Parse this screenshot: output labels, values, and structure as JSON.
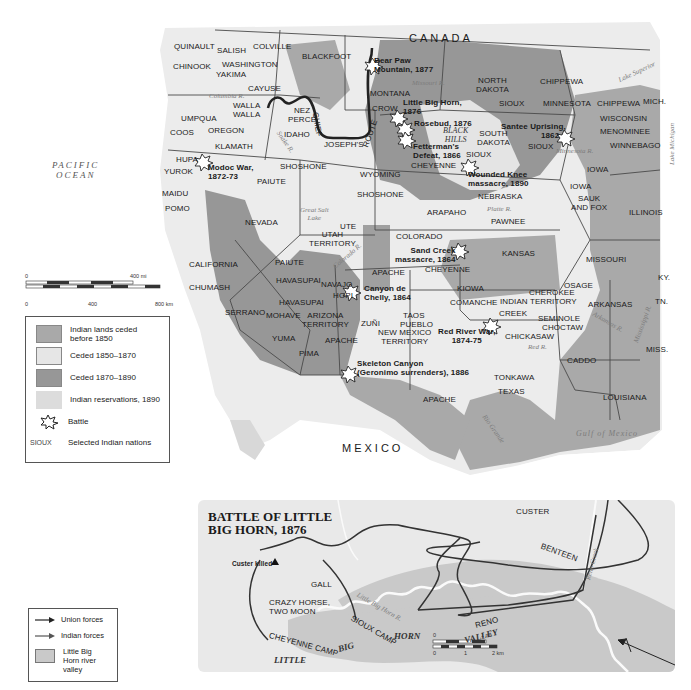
{
  "main_map": {
    "countries": {
      "canada": "CANADA",
      "mexico": "MEXICO"
    },
    "oceans": {
      "pacific": [
        "PACIFIC",
        "OCEAN"
      ],
      "gulf": "Gulf of Mexico"
    },
    "states": {
      "washington": "WASHINGTON",
      "oregon": "OREGON",
      "idaho": "IDAHO",
      "montana": "MONTANA",
      "wyoming": "WYOMING",
      "north_dakota": [
        "NORTH",
        "DAKOTA"
      ],
      "south_dakota": [
        "SOUTH",
        "DAKOTA"
      ],
      "nebraska": "NEBRASKA",
      "minnesota": "MINNESOTA",
      "wisconsin": "WISCONSIN",
      "mich": "MICH.",
      "iowa": "IOWA",
      "illinois": "ILLINOIS",
      "kansas": "KANSAS",
      "missouri": "MISSOURI",
      "ky": "KY.",
      "tn": "TN.",
      "arkansas": "ARKANSAS",
      "miss": "MISS.",
      "louisiana": "LOUISIANA",
      "texas": "TEXAS",
      "colorado": "COLORADO",
      "nevada": "NEVADA",
      "california": "CALIFORNIA",
      "utah_territory": [
        "UTAH",
        "TERRITORY"
      ],
      "arizona_territory": [
        "ARIZONA",
        "TERRITORY"
      ],
      "new_mexico_territory": [
        "NEW MEXICO",
        "TERRITORY"
      ],
      "indian_territory": "INDIAN TERRITORY"
    },
    "nations": {
      "quinault": "QUINAULT",
      "salish": "SALISH",
      "colville": "COLVILLE",
      "blackfoot": "BLACKFOOT",
      "chinook": "CHINOOK",
      "yakima": "YAKIMA",
      "cayuse": "CAYUSE",
      "walla_walla": [
        "WALLA",
        "WALLA"
      ],
      "umpqua": "UMPQUA",
      "coos": "COOS",
      "klamath": "KLAMATH",
      "nez_perce": [
        "NEZ",
        "PERCÉ"
      ],
      "hupa": "HUPA",
      "yurok": "YUROK",
      "shoshone_1": "SHOSHONE",
      "paiute_1": "PAIUTE",
      "maidu": "MAIDU",
      "pomo": "POMO",
      "crow": "CROW",
      "sioux_1": "SIOUX",
      "sioux_2": "SIOUX",
      "sioux_3": "SIOUX",
      "chippewa_1": "CHIPPEWA",
      "chippewa_2": "CHIPPEWA",
      "menominee": "MENOMINEE",
      "winnebago": "WINNEBAGO",
      "cheyenne_1": "CHEYENNE",
      "shoshone_2": "SHOSHONE",
      "sauk_fox": [
        "SAUK",
        "AND FOX"
      ],
      "iowa_nation": "IOWA",
      "pawnee": "PAWNEE",
      "arapaho": "ARAPAHO",
      "ute": "UTE",
      "cheyenne_2": "CHEYENNE",
      "apache_1": "APACHE",
      "paiute_2": "PAIUTE",
      "havasupai_1": "HAVASUPAI",
      "havasupai_2": "HAVASUPAI",
      "navajo": "NAVAJO",
      "hopi": "HOPI",
      "chumash": "CHUMASH",
      "serrano": "SERRANO",
      "mohave": "MOHAVE",
      "yuma": "YUMA",
      "pima": "PIMA",
      "apache_2": "APACHE",
      "zuni": "ZUÑI",
      "taos": "TAOS",
      "pueblo": "PUEBLO",
      "kiowa": "KIOWA",
      "comanche": "COMANCHE",
      "cherokee": "CHEROKEE",
      "creek": "CREEK",
      "osage": "OSAGE",
      "seminole": "SEMINOLE",
      "choctaw": "CHOCTAW",
      "chickasaw": "CHICKASAW",
      "caddo": "CADDO",
      "tonkawa": "TONKAWA",
      "apache_3": "APACHE"
    },
    "physical": {
      "columbia": "Columbia R.",
      "snake": "Snake R.",
      "missouri": "Missouri R.",
      "black_hills": [
        "BLACK",
        "HILLS"
      ],
      "great_salt_lake": [
        "Great Salt",
        "Lake"
      ],
      "colorado": "Colorado R.",
      "platte": "Platte R.",
      "minnesota": "Minnesota R.",
      "lake_superior": "Lake Superior",
      "lake_michigan": "Lake Michigan",
      "arkansas": "Arkansas R.",
      "mississippi": "Mississippi R.",
      "red": "Red R.",
      "rio_grande": "Rio Grande"
    },
    "route": [
      "CHIEF",
      "JOSEPH'S",
      "ROUTE"
    ],
    "battles": [
      {
        "name": "Bear Paw Mountain, 1877",
        "lines": [
          "Bear Paw",
          "Mountain, 1877"
        ]
      },
      {
        "name": "Little Big Horn, 1876",
        "lines": [
          "Little Big Horn,",
          "1876"
        ]
      },
      {
        "name": "Rosebud, 1876",
        "lines": [
          "Rosebud, 1876"
        ]
      },
      {
        "name": "Fetterman's Defeat, 1866",
        "lines": [
          "Fetterman's",
          "Defeat, 1866"
        ]
      },
      {
        "name": "Santee Uprising, 1862",
        "lines": [
          "Santee Uprising,",
          "1862"
        ]
      },
      {
        "name": "Wounded Knee massacre, 1890",
        "lines": [
          "Wounded Knee",
          "massacre, 1890"
        ]
      },
      {
        "name": "Modoc War, 1872-73",
        "lines": [
          "Modoc War,",
          "1872-73"
        ]
      },
      {
        "name": "Sand Creek massacre, 1864",
        "lines": [
          "Sand Creek",
          "massacre, 1864"
        ]
      },
      {
        "name": "Canyon de Chelly, 1864",
        "lines": [
          "Canyon de",
          "Chelly, 1864"
        ]
      },
      {
        "name": "Red River War, 1874-75",
        "lines": [
          "Red River War,",
          "1874-75"
        ]
      },
      {
        "name": "Skeleton Canyon (Geronimo surrenders), 1886",
        "lines": [
          "Skeleton Canyon",
          "(Geronimo surrenders), 1886"
        ]
      }
    ],
    "scale": {
      "mi_zero": "0",
      "mi_max": "400 mi",
      "km_zero": "0",
      "km_mid": "400",
      "km_max": "800 km"
    },
    "legend": {
      "items": [
        {
          "label": "Indian lands ceded before 1850",
          "lines": [
            "Indian lands ceded",
            "before 1850"
          ],
          "color": "#a9a9a9"
        },
        {
          "label": "Ceded 1850–1870",
          "lines": [
            "Ceded 1850–1870"
          ],
          "color": "#e4e4e4"
        },
        {
          "label": "Ceded 1870–1890",
          "lines": [
            "Ceded 1870–1890"
          ],
          "color": "#979797"
        },
        {
          "label": "Indian reservations, 1890",
          "lines": [
            "Indian reservations, 1890"
          ],
          "color": "#d4d4d4"
        }
      ],
      "battle_label": "Battle",
      "nation_sample": "SIOUX",
      "nation_label": "Selected Indian nations"
    },
    "colors": {
      "land_light": "#ececec",
      "ceded_pre1850": "#a9a9a9",
      "ceded_1850_1870": "#e4e4e4",
      "ceded_1870_1890": "#979797",
      "border": "#4a4a4a",
      "route": "#222222"
    }
  },
  "inset": {
    "title": [
      "BATTLE OF LITTLE",
      "BIG HORN, 1876"
    ],
    "labels": {
      "custer": "CUSTER",
      "benteen": "BENTEEN",
      "custer_killed": "Custer killed",
      "gall": "GALL",
      "crazy_horse": [
        "CRAZY HORSE,",
        "TWO MOON"
      ],
      "cheyenne_camp": "CHEYENNE CAMP",
      "sioux_camp": "SIOUX CAMP",
      "reno": "RENO",
      "little": "LITTLE",
      "big": "BIG",
      "horn": "HORN",
      "valley": "VALLEY",
      "little_big_horn_r": "Little Big Horn R.",
      "reno_creek": "Reno Creek"
    },
    "legend": {
      "union": "Union forces",
      "indian": "Indian forces",
      "valley": [
        "Little Big",
        "Horn river",
        "valley"
      ]
    },
    "scale": {
      "mi_zero": "0",
      "mi_max": "1 mi",
      "km_zero": "0",
      "km_mid": "1",
      "km_max": "2 km"
    }
  }
}
